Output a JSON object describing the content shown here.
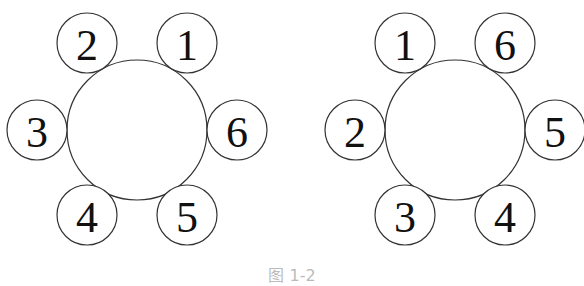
{
  "figure": {
    "caption": "图 1-2",
    "left": {
      "center": [
        137,
        130
      ],
      "radius": 70,
      "seats": [
        {
          "label": "2",
          "x": 87,
          "y": 43
        },
        {
          "label": "1",
          "x": 187,
          "y": 43
        },
        {
          "label": "3",
          "x": 37,
          "y": 130
        },
        {
          "label": "6",
          "x": 237,
          "y": 130
        },
        {
          "label": "4",
          "x": 87,
          "y": 215
        },
        {
          "label": "5",
          "x": 187,
          "y": 215
        }
      ]
    },
    "right": {
      "center": [
        455,
        130
      ],
      "radius": 70,
      "seats": [
        {
          "label": "1",
          "x": 405,
          "y": 43
        },
        {
          "label": "6",
          "x": 505,
          "y": 43
        },
        {
          "label": "2",
          "x": 355,
          "y": 130
        },
        {
          "label": "5",
          "x": 555,
          "y": 130
        },
        {
          "label": "3",
          "x": 405,
          "y": 215
        },
        {
          "label": "4",
          "x": 505,
          "y": 215
        }
      ]
    },
    "seat_radius": 30
  }
}
